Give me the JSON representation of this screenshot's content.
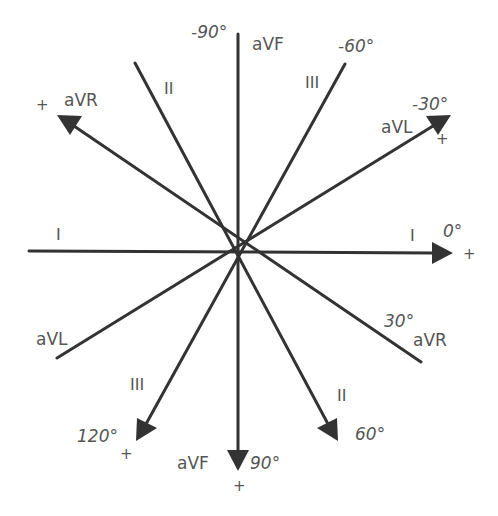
{
  "diagram": {
    "center": {
      "x": 238,
      "y": 252
    },
    "colors": {
      "line": "#333333",
      "text": "#555555",
      "background": "#ffffff"
    },
    "axes": [
      {
        "id": "aVF",
        "negative_end_label": "aVF",
        "negative_degrees": "-90°",
        "positive_lead_label": "aVF",
        "positive_degrees": "90°",
        "positive_sign": "+"
      },
      {
        "id": "I",
        "negative_end_label": "I",
        "positive_lead_label": "I",
        "positive_degrees": "0°",
        "positive_sign": "+"
      },
      {
        "id": "aVR",
        "positive_lead_label": "aVR",
        "positive_sign": "+",
        "negative_end_label": "aVR",
        "negative_degrees": "30°"
      },
      {
        "id": "aVL",
        "positive_lead_label": "aVL",
        "positive_degrees": "-30°",
        "positive_sign": "+",
        "negative_end_label": "aVL"
      },
      {
        "id": "II",
        "negative_end_label": "II",
        "positive_lead_label": "II",
        "positive_degrees": "60°"
      },
      {
        "id": "III",
        "negative_end_label": "III",
        "negative_degrees": "-60°",
        "positive_lead_label": "III",
        "positive_degrees": "120°",
        "positive_sign": "+"
      }
    ]
  },
  "labels": {
    "deg_neg90": "-90°",
    "avf_top": "aVF",
    "deg_neg60": "-60°",
    "iii_top": "III",
    "ii_top": "II",
    "avr_pos": "aVR",
    "avr_plus": "+",
    "avl_pos": "aVL",
    "deg_neg30": "-30°",
    "avl_plus": "+",
    "i_left": "I",
    "i_right": "I",
    "deg_0": "0°",
    "i_plus": "+",
    "deg_30": "30°",
    "avr_neg": "aVR",
    "avl_neg": "aVL",
    "iii_bottom": "III",
    "deg_120": "120°",
    "iii_plus": "+",
    "avf_bottom": "aVF",
    "deg_90": "90°",
    "avf_plus": "+",
    "ii_bottom": "II",
    "deg_60": "60°"
  }
}
